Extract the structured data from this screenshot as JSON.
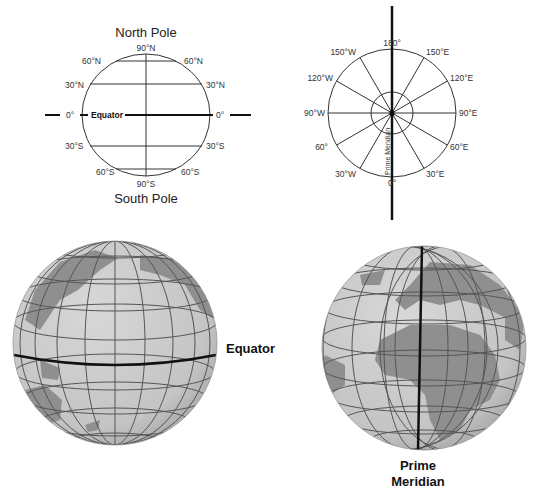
{
  "latitude_diagram": {
    "north_title": "North Pole",
    "south_title": "South Pole",
    "top_label": "90°N",
    "bottom_label": "90°S",
    "left_labels": [
      "60°N",
      "30°N",
      "0°",
      "30°S",
      "60°S"
    ],
    "right_labels": [
      "60°N",
      "30°N",
      "0°",
      "30°S",
      "60°S"
    ],
    "equator_label": "Equator"
  },
  "longitude_diagram": {
    "top_label": "180°",
    "bottom_label": "0°",
    "left_labels": [
      "150°W",
      "120°W",
      "90°W",
      "60°",
      "30°W"
    ],
    "right_labels": [
      "150°E",
      "120°E",
      "90°E",
      "60°E",
      "30°E"
    ],
    "meridian_label": "Prime Meridian"
  },
  "globe_equator": {
    "label": "Equator"
  },
  "globe_prime_meridian": {
    "label_line1": "Prime",
    "label_line2": "Meridian"
  },
  "colors": {
    "ocean": "#c9c9c9",
    "land": "#8f8f8f",
    "grid": "#555555",
    "highlight": "#111111"
  }
}
